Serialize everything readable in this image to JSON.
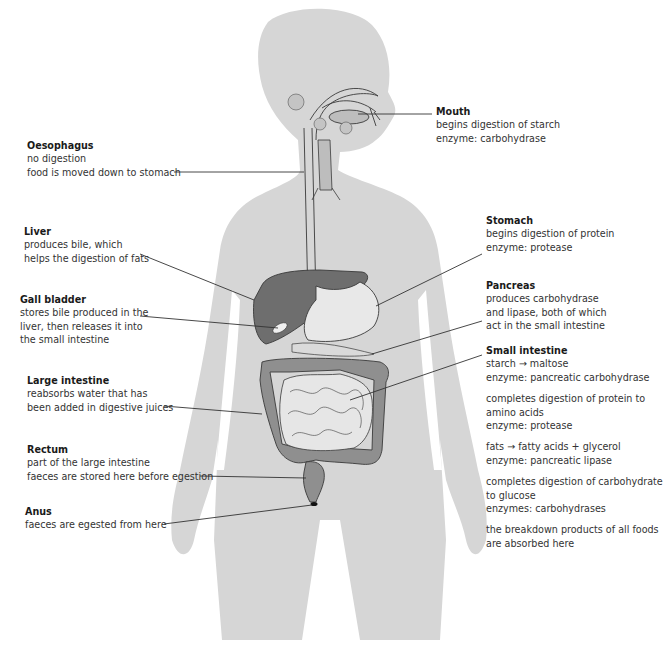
{
  "figure": {
    "colors": {
      "body_silhouette": "#d4d4d4",
      "liver": "#6e6e6e",
      "large_intestine": "#8f8f8f",
      "small_intestine": "#e6e6e6",
      "outline": "#3a3a3a",
      "leader_line": "#333333",
      "text": "#333333"
    }
  },
  "labels": {
    "mouth": {
      "title": "Mouth",
      "lines": [
        "begins digestion of starch",
        "enzyme: carbohydrase"
      ]
    },
    "oesophagus": {
      "title": "Oesophagus",
      "lines": [
        "no digestion",
        "food is moved down to stomach"
      ]
    },
    "liver": {
      "title": "Liver",
      "lines": [
        "produces bile, which",
        "helps the digestion of fats"
      ]
    },
    "gall_bladder": {
      "title": "Gall bladder",
      "lines": [
        "stores bile produced in the",
        "liver, then releases it into",
        "the small intestine"
      ]
    },
    "stomach": {
      "title": "Stomach",
      "lines": [
        "begins digestion of protein",
        "enzyme: protease"
      ]
    },
    "pancreas": {
      "title": "Pancreas",
      "lines": [
        "produces carbohydrase",
        "and lipase, both of which",
        "act in the small intestine"
      ]
    },
    "large_intestine": {
      "title": "Large intestine",
      "lines": [
        "reabsorbs water that has",
        "been added in digestive juices"
      ]
    },
    "rectum": {
      "title": "Rectum",
      "lines": [
        "part of the large intestine",
        "faeces are stored here before egestion"
      ]
    },
    "anus": {
      "title": "Anus",
      "lines": [
        "faeces are egested from here"
      ]
    },
    "small_intestine": {
      "title": "Small intestine",
      "groups": [
        [
          "starch → maltose",
          "enzyme: pancreatic carbohydrase"
        ],
        [
          "completes digestion of protein to",
          "amino acids",
          "enzyme: protease"
        ],
        [
          "fats → fatty acids + glycerol",
          "enzyme: pancreatic lipase"
        ],
        [
          "completes digestion of carbohydrate",
          "to glucose",
          "enzymes: carbohydrases"
        ],
        [
          "the breakdown products of all foods",
          "are absorbed here"
        ]
      ]
    }
  }
}
